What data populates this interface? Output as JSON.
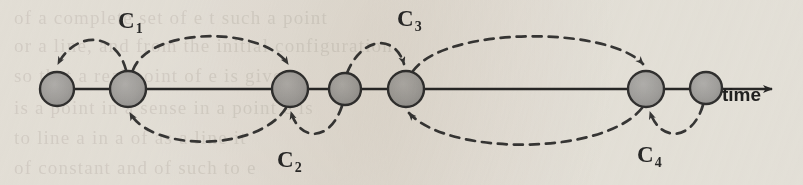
{
  "figure": {
    "name": "event-timeline-diagram",
    "axis_label": "time",
    "node_count": 7,
    "node_fill": "#a9a9a9",
    "node_stroke": "#333333",
    "line_color": "#2a2a2a",
    "dash_color": "#3a3a3a",
    "background": "#f4f2ee"
  },
  "nodes": [
    {
      "id": "node-1",
      "cx": 57,
      "cy": 89,
      "r": 17
    },
    {
      "id": "node-2",
      "cx": 128,
      "cy": 89,
      "r": 18
    },
    {
      "id": "node-3",
      "cx": 290,
      "cy": 89,
      "r": 18
    },
    {
      "id": "node-4",
      "cx": 345,
      "cy": 89,
      "r": 16
    },
    {
      "id": "node-5",
      "cx": 406,
      "cy": 89,
      "r": 18
    },
    {
      "id": "node-6",
      "cx": 646,
      "cy": 89,
      "r": 18
    },
    {
      "id": "node-7",
      "cx": 706,
      "cy": 88,
      "r": 16
    }
  ],
  "axis": {
    "start_x": 40,
    "end_x": 778,
    "y": 89,
    "arrow_tip_x": 778,
    "label_x": 722,
    "label_y": 84
  },
  "arc_labels": [
    {
      "id": "label-c1",
      "text": "C",
      "subscript": "1",
      "x": 118,
      "y": 8
    },
    {
      "id": "label-c2",
      "text": "C",
      "subscript": "2",
      "x": 277,
      "y": 147
    },
    {
      "id": "label-c3",
      "text": "C",
      "subscript": "3",
      "x": 397,
      "y": 6
    },
    {
      "id": "label-c4",
      "text": "C",
      "subscript": "4",
      "x": 637,
      "y": 142
    }
  ],
  "arcs": [
    {
      "id": "arc-c1-short-top",
      "from": "node-2",
      "to": "node-1",
      "side": "above",
      "label": "C1"
    },
    {
      "id": "arc-c1-long-top",
      "from": "node-2",
      "to": "node-3",
      "side": "above",
      "label": "C1"
    },
    {
      "id": "arc-c2-long-bottom",
      "from": "node-3",
      "to": "node-2",
      "side": "below",
      "label": "C2"
    },
    {
      "id": "arc-c2-short-bottom",
      "from": "node-4",
      "to": "node-3",
      "side": "below",
      "label": "C2"
    },
    {
      "id": "arc-c3-short-top",
      "from": "node-4",
      "to": "node-5",
      "side": "above",
      "label": "C3"
    },
    {
      "id": "arc-c3-long-top",
      "from": "node-5",
      "to": "node-6",
      "side": "above",
      "label": "C3"
    },
    {
      "id": "arc-c4-long-bottom",
      "from": "node-6",
      "to": "node-5",
      "side": "below",
      "label": "C4"
    },
    {
      "id": "arc-c4-short-bottom",
      "from": "node-7",
      "to": "node-6",
      "side": "below",
      "label": "C4"
    }
  ],
  "bleed_text": {
    "rows": [
      {
        "y": 2,
        "text": "of a complete set of e t such a point"
      },
      {
        "y": 30,
        "text": "or a line, and from the initial configuration"
      },
      {
        "y": 60,
        "text": "so that a real point of e is given"
      },
      {
        "y": 92,
        "text": "is a point in a sense in a point e is"
      },
      {
        "y": 122,
        "text": "to line a in a of as a line it"
      },
      {
        "y": 152,
        "text": "of constant and of such to e"
      }
    ]
  }
}
